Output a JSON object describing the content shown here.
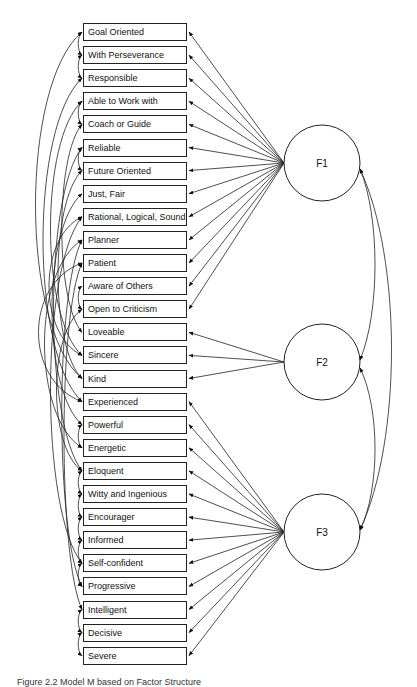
{
  "diagram": {
    "indicators": [
      {
        "label": "Goal Oriented",
        "factor": "F1"
      },
      {
        "label": "With Perseverance",
        "factor": "F1"
      },
      {
        "label": "Responsible",
        "factor": "F1"
      },
      {
        "label": "Able to Work with",
        "factor": "F1"
      },
      {
        "label": "Coach or Guide",
        "factor": "F1"
      },
      {
        "label": "Reliable",
        "factor": "F1"
      },
      {
        "label": "Future Oriented",
        "factor": "F1"
      },
      {
        "label": "Just, Fair",
        "factor": "F1"
      },
      {
        "label": "Rational, Logical, Sound",
        "factor": "F1"
      },
      {
        "label": "Planner",
        "factor": "F1"
      },
      {
        "label": "Patient",
        "factor": "F1"
      },
      {
        "label": "Aware of Others",
        "factor": "F1"
      },
      {
        "label": "Open to Criticism",
        "factor": "F1"
      },
      {
        "label": "Loveable",
        "factor": "F2"
      },
      {
        "label": "Sincere",
        "factor": "F2"
      },
      {
        "label": "Kind",
        "factor": "F2"
      },
      {
        "label": "Experienced",
        "factor": "F3"
      },
      {
        "label": "Powerful",
        "factor": "F3"
      },
      {
        "label": "Energetic",
        "factor": "F3"
      },
      {
        "label": "Eloquent",
        "factor": "F3"
      },
      {
        "label": "Witty and Ingenious",
        "factor": "F3"
      },
      {
        "label": "Encourager",
        "factor": "F3"
      },
      {
        "label": "Informed",
        "factor": "F3"
      },
      {
        "label": "Self-confident",
        "factor": "F3"
      },
      {
        "label": "Progressive",
        "factor": "F3"
      },
      {
        "label": "Intelligent",
        "factor": "F3"
      },
      {
        "label": "Decisive",
        "factor": "F3"
      },
      {
        "label": "Severe",
        "factor": "F3"
      }
    ],
    "factors": [
      {
        "id": "F1",
        "label": "F1",
        "cx": 322,
        "cy": 163,
        "r": 38
      },
      {
        "id": "F2",
        "label": "F2",
        "cx": 322,
        "cy": 362,
        "r": 38
      },
      {
        "id": "F3",
        "label": "F3",
        "cx": 322,
        "cy": 532,
        "r": 38
      }
    ],
    "factor_covariances": [
      {
        "from": "F1",
        "to": "F2",
        "bulge_x": 380
      },
      {
        "from": "F2",
        "to": "F3",
        "bulge_x": 380
      },
      {
        "from": "F1",
        "to": "F3",
        "bulge_x": 402
      }
    ],
    "error_covariances": [
      {
        "a": 0,
        "b": 1,
        "bulge_x": 77
      },
      {
        "a": 1,
        "b": 2,
        "bulge_x": 77
      },
      {
        "a": 3,
        "b": 4,
        "bulge_x": 77
      },
      {
        "a": 5,
        "b": 6,
        "bulge_x": 77
      },
      {
        "a": 11,
        "b": 12,
        "bulge_x": 77
      },
      {
        "a": 17,
        "b": 18,
        "bulge_x": 77
      },
      {
        "a": 19,
        "b": 20,
        "bulge_x": 77
      },
      {
        "a": 20,
        "b": 21,
        "bulge_x": 77
      },
      {
        "a": 21,
        "b": 22,
        "bulge_x": 77
      },
      {
        "a": 22,
        "b": 23,
        "bulge_x": 77
      },
      {
        "a": 23,
        "b": 24,
        "bulge_x": 77
      },
      {
        "a": 25,
        "b": 26,
        "bulge_x": 77
      },
      {
        "a": 26,
        "b": 27,
        "bulge_x": 77
      },
      {
        "a": 0,
        "b": 15,
        "bulge_x": 20
      },
      {
        "a": 2,
        "b": 16,
        "bulge_x": 30
      },
      {
        "a": 3,
        "b": 14,
        "bulge_x": 40
      },
      {
        "a": 5,
        "b": 19,
        "bulge_x": 44
      },
      {
        "a": 4,
        "b": 13,
        "bulge_x": 55
      },
      {
        "a": 6,
        "b": 15,
        "bulge_x": 50
      },
      {
        "a": 7,
        "b": 17,
        "bulge_x": 42
      },
      {
        "a": 8,
        "b": 23,
        "bulge_x": 40
      },
      {
        "a": 9,
        "b": 24,
        "bulge_x": 55
      },
      {
        "a": 10,
        "b": 25,
        "bulge_x": 58
      },
      {
        "a": 8,
        "b": 14,
        "bulge_x": 38
      },
      {
        "a": 9,
        "b": 18,
        "bulge_x": 32
      },
      {
        "a": 10,
        "b": 16,
        "bulge_x": 24
      },
      {
        "a": 12,
        "b": 19,
        "bulge_x": 48
      }
    ],
    "caption": "Figure 2.2  Model M based on Factor Structure"
  }
}
